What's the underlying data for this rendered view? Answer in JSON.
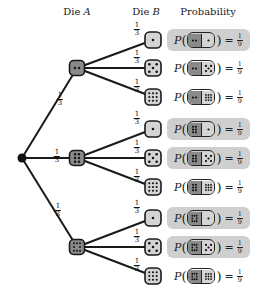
{
  "headers": {
    "die_a": "Die A",
    "die_a_prefix": "Die ",
    "die_a_var": "A",
    "die_b_prefix": "Die ",
    "die_b_var": "B",
    "probability": "Probability"
  },
  "colors": {
    "die_a_fill": "#8a8a8a",
    "die_b_fill": "#d4d4d4",
    "highlight_bg": "#cfcfcf",
    "line": "#1a1a1a"
  },
  "root": {
    "x": 22,
    "y": 158
  },
  "branch_prob": {
    "num": "1",
    "den": "3"
  },
  "die_a": [
    {
      "face": 2,
      "x": 77,
      "y": 68
    },
    {
      "face": 6,
      "x": 77,
      "y": 158
    },
    {
      "face": 8,
      "x": 77,
      "y": 247
    }
  ],
  "die_b_faces": [
    1,
    5,
    9
  ],
  "outcomes": [
    {
      "a": 2,
      "b": 1,
      "y": 40,
      "highlight": true,
      "label_p": "P",
      "eq": "=",
      "num": "1",
      "den": "9"
    },
    {
      "a": 2,
      "b": 5,
      "y": 68,
      "highlight": false,
      "label_p": "P",
      "eq": "=",
      "num": "1",
      "den": "9"
    },
    {
      "a": 2,
      "b": 9,
      "y": 97,
      "highlight": false,
      "label_p": "P",
      "eq": "=",
      "num": "1",
      "den": "9"
    },
    {
      "a": 6,
      "b": 1,
      "y": 129,
      "highlight": true,
      "label_p": "P",
      "eq": "=",
      "num": "1",
      "den": "9"
    },
    {
      "a": 6,
      "b": 5,
      "y": 158,
      "highlight": true,
      "label_p": "P",
      "eq": "=",
      "num": "1",
      "den": "9"
    },
    {
      "a": 6,
      "b": 9,
      "y": 187,
      "highlight": false,
      "label_p": "P",
      "eq": "=",
      "num": "1",
      "den": "9"
    },
    {
      "a": 8,
      "b": 1,
      "y": 218,
      "highlight": true,
      "label_p": "P",
      "eq": "=",
      "num": "1",
      "den": "9"
    },
    {
      "a": 8,
      "b": 5,
      "y": 247,
      "highlight": true,
      "label_p": "P",
      "eq": "=",
      "num": "1",
      "den": "9"
    },
    {
      "a": 8,
      "b": 9,
      "y": 276,
      "highlight": false,
      "label_p": "P",
      "eq": "=",
      "num": "1",
      "den": "9"
    }
  ]
}
